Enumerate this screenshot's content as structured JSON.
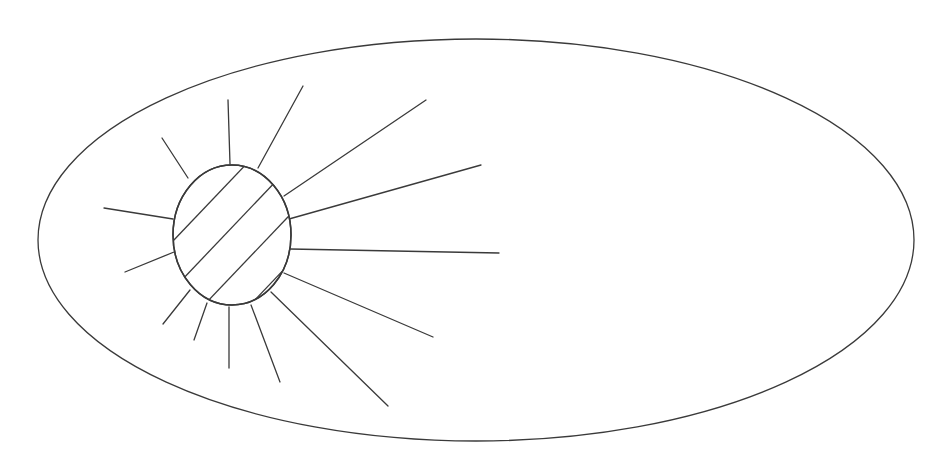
{
  "diagram": {
    "elements": {
      "outer_boundary": {
        "shape": "ellipse",
        "label": ""
      },
      "core": {
        "shape": "oval",
        "fill_pattern": "diagonal-hatch",
        "label": ""
      },
      "rays": {
        "count": 15,
        "label": ""
      }
    },
    "colors": {
      "line": "#3a3a3a",
      "background": "#ffffff"
    }
  }
}
